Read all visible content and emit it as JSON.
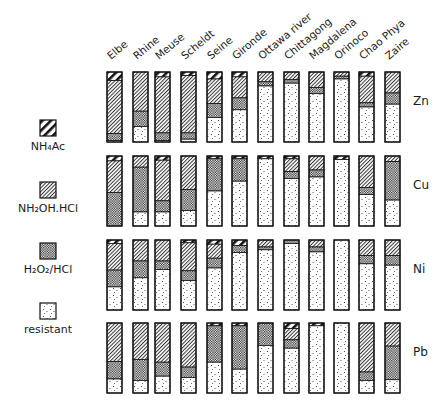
{
  "chart_data": {
    "type": "bar",
    "subtype": "stacked-100-percent",
    "title": "",
    "xlabel": "",
    "ylabel": "",
    "categories": [
      "Elbe",
      "Rhine",
      "Meuse",
      "Scheldt",
      "Seine",
      "Gironde",
      "Ottawa river",
      "Chittagong",
      "Magdalena",
      "Orinoco",
      "Chao Phya",
      "Zaire"
    ],
    "legend": [
      {
        "key": "nh4ac",
        "label": "NH₄Ac",
        "pattern": "wide-hatch"
      },
      {
        "key": "nh2oh",
        "label": "NH₂OH.HCl",
        "pattern": "fine-hatch"
      },
      {
        "key": "h2o2",
        "label": "H₂O₂/HCl",
        "pattern": "crosshatch"
      },
      {
        "key": "resistant",
        "label": "resistant",
        "pattern": "dots"
      }
    ],
    "legend_position": "left",
    "grid": false,
    "ylim": [
      0,
      100
    ],
    "panels": [
      {
        "element": "Zn",
        "series": {
          "nh4ac": [
            12,
            0,
            7,
            5,
            10,
            7,
            0,
            0,
            0,
            0,
            6,
            0
          ],
          "nh2oh": [
            76,
            56,
            80,
            82,
            35,
            30,
            14,
            11,
            22,
            6,
            38,
            30
          ],
          "h2o2": [
            10,
            22,
            11,
            9,
            20,
            17,
            6,
            5,
            9,
            4,
            6,
            16
          ],
          "resistant": [
            2,
            22,
            2,
            4,
            35,
            46,
            80,
            84,
            69,
            90,
            50,
            54
          ]
        }
      },
      {
        "element": "Cu",
        "series": {
          "nh4ac": [
            7,
            0,
            6,
            0,
            4,
            4,
            4,
            4,
            0,
            5,
            0,
            0
          ],
          "nh2oh": [
            45,
            16,
            58,
            48,
            0,
            0,
            0,
            18,
            20,
            0,
            45,
            8
          ],
          "h2o2": [
            48,
            64,
            16,
            30,
            46,
            32,
            0,
            10,
            10,
            0,
            10,
            55
          ],
          "resistant": [
            0,
            20,
            20,
            22,
            50,
            64,
            96,
            68,
            70,
            95,
            45,
            37
          ]
        }
      },
      {
        "element": "Ni",
        "series": {
          "nh4ac": [
            5,
            0,
            0,
            4,
            6,
            8,
            0,
            0,
            0,
            0,
            0,
            0
          ],
          "nh2oh": [
            38,
            30,
            30,
            40,
            20,
            0,
            10,
            0,
            10,
            0,
            22,
            22
          ],
          "h2o2": [
            24,
            24,
            12,
            14,
            14,
            10,
            4,
            5,
            7,
            0,
            12,
            14
          ],
          "resistant": [
            33,
            46,
            58,
            42,
            60,
            82,
            86,
            95,
            83,
            100,
            66,
            64
          ]
        }
      },
      {
        "element": "Pb",
        "series": {
          "nh4ac": [
            0,
            0,
            0,
            0,
            4,
            4,
            0,
            8,
            4,
            0,
            0,
            0
          ],
          "nh2oh": [
            55,
            52,
            56,
            63,
            0,
            0,
            0,
            16,
            0,
            0,
            70,
            33
          ],
          "h2o2": [
            25,
            30,
            20,
            15,
            52,
            62,
            32,
            12,
            0,
            0,
            12,
            48
          ],
          "resistant": [
            20,
            18,
            24,
            22,
            44,
            34,
            68,
            64,
            96,
            100,
            18,
            19
          ]
        }
      }
    ]
  }
}
